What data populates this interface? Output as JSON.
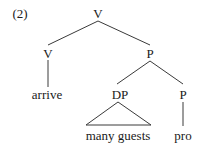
{
  "example_number": "(2)",
  "tree": {
    "root": {
      "label": "V"
    },
    "left_child": {
      "label": "V",
      "terminal": "arrive"
    },
    "right_child": {
      "label": "P",
      "left": {
        "label": "DP",
        "terminal": "many guests",
        "triangle": true
      },
      "right": {
        "label": "P",
        "terminal": "pro"
      }
    }
  },
  "colors": {
    "line": "#3a3a3a",
    "text": "#1a1a1a",
    "background": "#ffffff"
  }
}
